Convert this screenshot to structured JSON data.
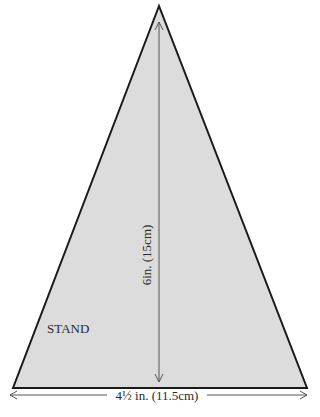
{
  "diagram": {
    "piece_label": "STAND",
    "height_label": "6in. (15cm)",
    "width_label": "4½ in. (11.5cm)",
    "colors": {
      "fill": "#dcdcdc",
      "outline": "#1a1a1a",
      "dimension_line": "#555555",
      "text": "#2a2a2a"
    }
  }
}
